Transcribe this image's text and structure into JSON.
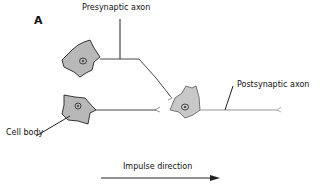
{
  "figure": {
    "panel_label": "A",
    "labels": {
      "presynaptic_axon": "Presynaptic axon",
      "postsynaptic_axon": "Postsynaptic axon",
      "cell_body": "Cell body",
      "impulse_direction": "Impulse direction"
    },
    "colors": {
      "cell_fill": "#b8b8b8",
      "cell_fill_post": "#c8c8c8",
      "line": "#222222",
      "axon_gray": "#888888"
    }
  }
}
